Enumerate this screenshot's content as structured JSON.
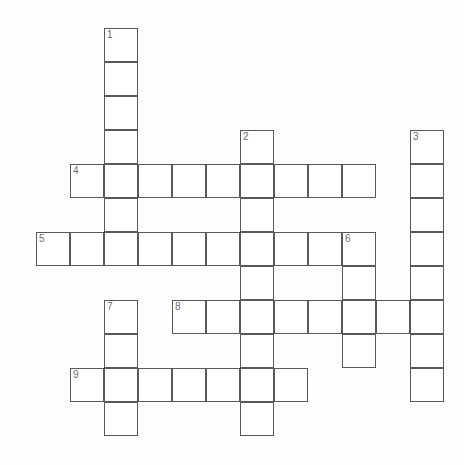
{
  "puzzle": {
    "title": "Crossword Grid",
    "geometry": {
      "cell_size": 34,
      "origin_x": 2,
      "origin_y": 28,
      "canvas_width": 464,
      "canvas_height": 465
    },
    "colors": {
      "background": "#fdfdfd",
      "cell_fill": "#ffffff",
      "cell_border": "#55595c",
      "number_text": "#6a6e70"
    },
    "entries": [
      {
        "number": "1",
        "direction": "down",
        "start_col": 3,
        "start_row": 0,
        "length": 7
      },
      {
        "number": "2",
        "direction": "down",
        "start_col": 7,
        "start_row": 3,
        "length": 9
      },
      {
        "number": "3",
        "direction": "down",
        "start_col": 12,
        "start_row": 3,
        "length": 8
      },
      {
        "number": "4",
        "direction": "across",
        "start_col": 2,
        "start_row": 4,
        "length": 9
      },
      {
        "number": "5",
        "direction": "across",
        "start_col": 1,
        "start_row": 6,
        "length": 10
      },
      {
        "number": "6",
        "direction": "down",
        "start_col": 10,
        "start_row": 6,
        "length": 4
      },
      {
        "number": "7",
        "direction": "down",
        "start_col": 3,
        "start_row": 8,
        "length": 4
      },
      {
        "number": "8",
        "direction": "across",
        "start_col": 5,
        "start_row": 8,
        "length": 8
      },
      {
        "number": "9",
        "direction": "across",
        "start_col": 2,
        "start_row": 10,
        "length": 7
      }
    ],
    "numbered_cells": [
      {
        "label": "1",
        "col": 3,
        "row": 0
      },
      {
        "label": "2",
        "col": 7,
        "row": 3
      },
      {
        "label": "3",
        "col": 12,
        "row": 3
      },
      {
        "label": "4",
        "col": 2,
        "row": 4
      },
      {
        "label": "5",
        "col": 1,
        "row": 6
      },
      {
        "label": "6",
        "col": 10,
        "row": 6
      },
      {
        "label": "7",
        "col": 3,
        "row": 8
      },
      {
        "label": "8",
        "col": 5,
        "row": 8
      },
      {
        "label": "9",
        "col": 2,
        "row": 10
      }
    ],
    "letters": {}
  }
}
